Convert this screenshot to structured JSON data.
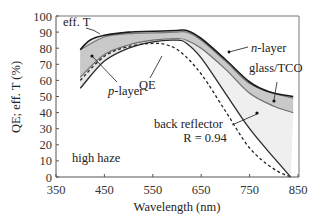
{
  "chart_data": {
    "type": "line",
    "title": "",
    "xlabel": "Wavelength (nm)",
    "ylabel": "QE; eff. T (%)",
    "xlim": [
      350,
      850
    ],
    "ylim": [
      0,
      100
    ],
    "xticks": [
      350,
      450,
      550,
      650,
      750,
      850
    ],
    "yticks": [
      0,
      10,
      20,
      30,
      40,
      50,
      60,
      70,
      80,
      90,
      100
    ],
    "grid": false,
    "series": [
      {
        "name": "eff. T",
        "style": "solid-dark",
        "x": [
          400,
          420,
          450,
          500,
          550,
          600,
          620,
          650,
          700,
          750,
          790,
          840
        ],
        "y": [
          79,
          85,
          88,
          90,
          90.5,
          91,
          91,
          86,
          73,
          59,
          53,
          50
        ]
      },
      {
        "name": "n-layer",
        "style": "solid-gray",
        "x": [
          400,
          450,
          500,
          550,
          600,
          620,
          650,
          700,
          750,
          800,
          840
        ],
        "y": [
          79,
          87,
          89,
          89.5,
          90,
          90,
          85,
          72,
          58,
          52,
          49
        ]
      },
      {
        "name": "glass/TCO",
        "style": "solid-gray",
        "x": [
          400,
          450,
          500,
          550,
          600,
          620,
          650,
          700,
          750,
          800,
          840
        ],
        "y": [
          62,
          76,
          82,
          85,
          86,
          85,
          80,
          67,
          52,
          44,
          40
        ]
      },
      {
        "name": "p-layer / back reflector boundary",
        "style": "solid-dark",
        "x": [
          400,
          450,
          500,
          550,
          600,
          620,
          650,
          700,
          750,
          800,
          835
        ],
        "y": [
          55,
          72,
          80,
          84,
          85,
          83,
          74,
          52,
          30,
          12,
          0
        ]
      },
      {
        "name": "QE",
        "style": "dashed",
        "x": [
          400,
          450,
          500,
          550,
          580,
          610,
          650,
          700,
          750,
          800,
          835
        ],
        "y": [
          60,
          75,
          81,
          83,
          82,
          77,
          64,
          41,
          18,
          5,
          0
        ]
      }
    ],
    "annotations": [
      {
        "text": "eff. T",
        "x": 370,
        "y": 89
      },
      {
        "text": "p-layer",
        "x": 460,
        "y": 48
      },
      {
        "text": "QE",
        "x": 560,
        "y": 58
      },
      {
        "text": "n-layer",
        "x": 745,
        "y": 78
      },
      {
        "text": "glass/TCO",
        "x": 730,
        "y": 65
      },
      {
        "text": "back reflector",
        "x": 575,
        "y": 38
      },
      {
        "text": "R = 0.94",
        "x": 590,
        "y": 29
      },
      {
        "text": "high haze",
        "x": 375,
        "y": 13
      }
    ],
    "legend": "none (inline annotations)"
  },
  "axis": {
    "x_ticks": [
      "350",
      "450",
      "550",
      "650",
      "750",
      "850"
    ],
    "y_ticks": [
      "0",
      "10",
      "20",
      "30",
      "40",
      "50",
      "60",
      "70",
      "80",
      "90",
      "100"
    ],
    "x_title": "Wavelength (nm)",
    "y_title": "QE; eff. T (%)"
  },
  "labels": {
    "eff_t": "eff. T",
    "p_layer_italic": "p",
    "p_layer_rest": "-layer",
    "qe": "QE",
    "n_layer_italic": "n",
    "n_layer_rest": "-layer",
    "glass_tco": "glass/TCO",
    "back_reflector": "back reflector",
    "reflectance": "R = 0.94",
    "high_haze": "high haze"
  },
  "colors": {
    "dark_line": "#1e1e1e",
    "gray_line": "#6e6e6e",
    "fill_light": "#ececec",
    "fill_mid": "#d2d2d2",
    "fill_band": "#bdbdbd",
    "axis": "#555555"
  }
}
